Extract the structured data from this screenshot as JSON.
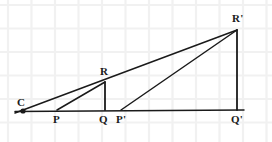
{
  "figure": {
    "width": 272,
    "height": 142,
    "background_color": "#ffffff",
    "stroke_color": "#1a1a1a",
    "grid_color": "#f0f0f0"
  },
  "grid": {
    "spacing": 23.5,
    "x_offset": 8,
    "y_offset": 5,
    "line_color": "#f1f1f1",
    "line_width": 2.2,
    "visible": true
  },
  "points": {
    "C": {
      "label": "C",
      "x": 23,
      "y": 111,
      "label_x": 17,
      "label_y": 97,
      "marker": "dot"
    },
    "P": {
      "label": "P",
      "x": 57,
      "y": 110,
      "label_x": 53,
      "label_y": 114,
      "marker": "none"
    },
    "Q": {
      "label": "Q",
      "x": 105,
      "y": 110,
      "label_x": 99,
      "label_y": 114,
      "marker": "none"
    },
    "R": {
      "label": "R",
      "x": 105,
      "y": 82,
      "label_x": 100,
      "label_y": 66,
      "marker": "none"
    },
    "Pp": {
      "label": "P'",
      "x": 121,
      "y": 110,
      "label_x": 116,
      "label_y": 114,
      "marker": "none"
    },
    "Qp": {
      "label": "Q'",
      "x": 237,
      "y": 110,
      "label_x": 231,
      "label_y": 114,
      "marker": "none"
    },
    "Rp": {
      "label": "R'",
      "x": 237,
      "y": 30,
      "label_x": 232,
      "label_y": 13,
      "marker": "none"
    }
  },
  "segments": [
    {
      "name": "baseline-C-to-Qprime",
      "from": [
        15,
        111.5
      ],
      "to": [
        244,
        110
      ],
      "width": 1.5
    },
    {
      "name": "ray-C-through-R-to-Rprime",
      "from": [
        15,
        113
      ],
      "to": [
        237,
        30
      ],
      "width": 1.5
    },
    {
      "name": "segment-P-to-R",
      "from": [
        57,
        110
      ],
      "to": [
        105,
        82
      ],
      "width": 1.5
    },
    {
      "name": "vertical-R-to-Q",
      "from": [
        105,
        82
      ],
      "to": [
        105,
        110
      ],
      "width": 1.8
    },
    {
      "name": "segment-Pprime-to-Rprime",
      "from": [
        121,
        110
      ],
      "to": [
        237,
        30
      ],
      "width": 1.5
    },
    {
      "name": "vertical-Rprime-to-Qprime",
      "from": [
        237,
        30
      ],
      "to": [
        237,
        110
      ],
      "width": 1.8
    }
  ],
  "labels_order": [
    "C",
    "P",
    "Q",
    "R",
    "Pp",
    "Qp",
    "Rp"
  ]
}
